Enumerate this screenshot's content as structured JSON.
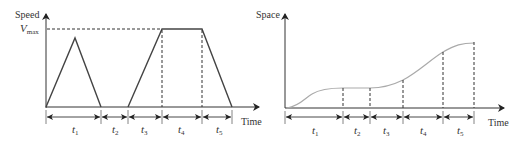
{
  "left_chart": {
    "title": "Speed vs Time profile",
    "y_label": "Speed",
    "x_label": "Time",
    "vmax_label": "V",
    "vmax_sub": "max",
    "intervals": [
      {
        "label": "t",
        "sub": "1"
      },
      {
        "label": "t",
        "sub": "2"
      },
      {
        "label": "t",
        "sub": "3"
      },
      {
        "label": "t",
        "sub": "4"
      },
      {
        "label": "t",
        "sub": "5"
      }
    ]
  },
  "right_chart": {
    "title": "Space vs Time profile",
    "y_label": "Space",
    "x_label": "Time",
    "intervals": [
      {
        "label": "t",
        "sub": "1"
      },
      {
        "label": "t",
        "sub": "2"
      },
      {
        "label": "t",
        "sub": "3"
      },
      {
        "label": "t",
        "sub": "4"
      },
      {
        "label": "t",
        "sub": "5"
      }
    ]
  },
  "colors": {
    "axis": "#333333",
    "speed_line": "#444444",
    "space_curve": "#aaaaaa",
    "background": "#ffffff"
  }
}
